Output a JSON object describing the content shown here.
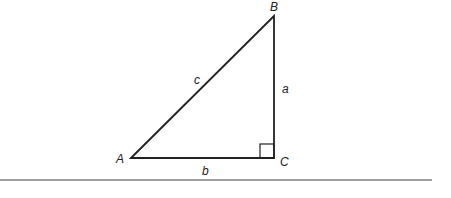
{
  "diagram": {
    "type": "right-triangle",
    "vertices": {
      "A": {
        "label": "A",
        "x": 131,
        "y": 158
      },
      "B": {
        "label": "B",
        "x": 274,
        "y": 16
      },
      "C": {
        "label": "C",
        "x": 274,
        "y": 158
      }
    },
    "sides": {
      "a": {
        "label": "a",
        "between": [
          "B",
          "C"
        ]
      },
      "b": {
        "label": "b",
        "between": [
          "A",
          "C"
        ]
      },
      "c": {
        "label": "c",
        "between": [
          "A",
          "B"
        ]
      }
    },
    "right_angle_at": "C",
    "stroke_color": "#222222"
  }
}
